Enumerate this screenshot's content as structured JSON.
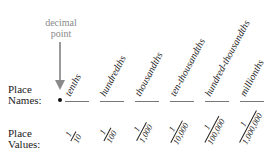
{
  "decimal_point": {
    "label_line1": "decimal",
    "label_line2": "point",
    "color": "#8a8a8a"
  },
  "rows": {
    "names": {
      "line1": "Place",
      "line2": "Names:"
    },
    "values": {
      "line1": "Place",
      "line2": "Values:"
    }
  },
  "places": [
    {
      "name": "tenths",
      "numerator": "1",
      "denominator": "10"
    },
    {
      "name": "hundredths",
      "numerator": "1",
      "denominator": "100"
    },
    {
      "name": "thousandths",
      "numerator": "1",
      "denominator": "1,000"
    },
    {
      "name": "ten-thousandths",
      "numerator": "1",
      "denominator": "10,000"
    },
    {
      "name": "hundred-thousandths",
      "numerator": "1",
      "denominator": "100,000"
    },
    {
      "name": "millionths",
      "numerator": "1",
      "denominator": "1,000,000"
    }
  ]
}
